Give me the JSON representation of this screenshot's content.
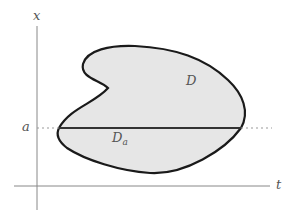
{
  "diagram": {
    "type": "region-in-plane",
    "axes": {
      "vertical_label": "x",
      "horizontal_label": "t"
    },
    "level": {
      "label": "a",
      "style": "dashed"
    },
    "region": {
      "label": "D",
      "fill": "#e6e6e6",
      "stroke": "#1a1a1a"
    },
    "subregion": {
      "label_main": "D",
      "label_sub": "a"
    },
    "colors": {
      "axis": "#888888",
      "dashed": "#999999",
      "chord": "#333333",
      "text": "#555555"
    }
  }
}
